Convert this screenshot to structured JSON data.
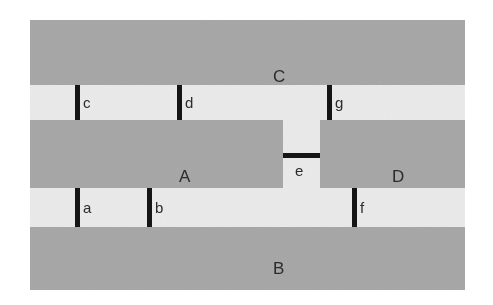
{
  "figure": {
    "kind": "schematic-diagram",
    "background_color": "#ffffff",
    "corridor_color": "#ebebeb",
    "region_color": "#a8a8a8",
    "gate_color": "#151515",
    "label_color": "#2b2b2b"
  },
  "regions": [
    {
      "id": "C",
      "label": "C",
      "label_x": 243,
      "label_y": 48
    },
    {
      "id": "A",
      "label": "A",
      "label_x": 149,
      "label_y": 148
    },
    {
      "id": "D",
      "label": "D",
      "label_x": 362,
      "label_y": 148
    },
    {
      "id": "B",
      "label": "B",
      "label_x": 243,
      "label_y": 240
    }
  ],
  "gates": [
    {
      "id": "a",
      "label": "a",
      "orientation": "vertical",
      "label_x": 53,
      "label_y": 195
    },
    {
      "id": "b",
      "label": "b",
      "orientation": "vertical",
      "label_x": 125,
      "label_y": 195
    },
    {
      "id": "c",
      "label": "c",
      "orientation": "vertical",
      "label_x": 53,
      "label_y": 92
    },
    {
      "id": "d",
      "label": "d",
      "orientation": "vertical",
      "label_x": 155,
      "label_y": 92
    },
    {
      "id": "e",
      "label": "e",
      "orientation": "horizontal",
      "label_x": 265,
      "label_y": 143
    },
    {
      "id": "f",
      "label": "f",
      "orientation": "vertical",
      "label_x": 330,
      "label_y": 195
    },
    {
      "id": "g",
      "label": "g",
      "orientation": "vertical",
      "label_x": 305,
      "label_y": 92
    }
  ]
}
